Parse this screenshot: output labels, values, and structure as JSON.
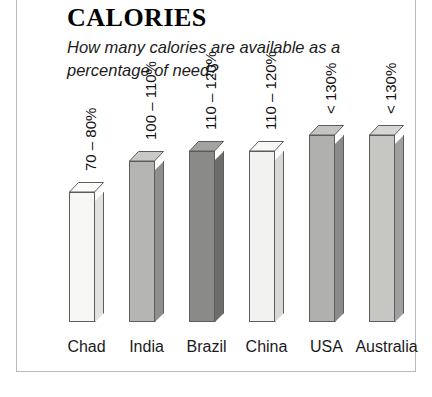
{
  "figure": {
    "title": "CALORIES",
    "subtitle": "How many calories are available as a percentage of need?"
  },
  "chart_data": {
    "type": "bar",
    "title": "CALORIES",
    "subtitle": "How many calories are available as a percentage of need?",
    "xlabel": "",
    "ylabel": "",
    "grid": false,
    "legend": "none",
    "style": "3d-columns",
    "ylim": [
      0,
      140
    ],
    "categories": [
      "Chad",
      "India",
      "Brazil",
      "China",
      "USA",
      "Australia"
    ],
    "value_labels": [
      "70 – 80%",
      "100 – 110%",
      "110 – 120%",
      "110 – 120%",
      "< 130%",
      "< 130%"
    ],
    "values": [
      75,
      105,
      115,
      115,
      130,
      130
    ],
    "bars": [
      {
        "category": "Chad",
        "value_label": "70 – 80%",
        "value": 75,
        "front_color": "#f7f7f5",
        "side_color": "#e2e2df",
        "top_color": "#fcfcfb"
      },
      {
        "category": "India",
        "value_label": "100 – 110%",
        "value": 105,
        "front_color": "#b5b5b3",
        "side_color": "#8e8e8c",
        "top_color": "#c9c9c6"
      },
      {
        "category": "Brazil",
        "value_label": "110 – 120%",
        "value": 115,
        "front_color": "#8a8a88",
        "side_color": "#6d6d6b",
        "top_color": "#a3a3a0"
      },
      {
        "category": "China",
        "value_label": "110 – 120%",
        "value": 115,
        "front_color": "#f2f2f0",
        "side_color": "#d8d8d4",
        "top_color": "#f8f8f6"
      },
      {
        "category": "USA",
        "value_label": "< 130%",
        "value": 130,
        "front_color": "#b0b0ae",
        "side_color": "#8a8a88",
        "top_color": "#c4c4c1"
      },
      {
        "category": "Australia",
        "value_label": "< 130%",
        "value": 130,
        "front_color": "#c6c6c3",
        "side_color": "#a0a09e",
        "top_color": "#d6d6d3"
      }
    ]
  },
  "colors": {
    "frame_border": "#b9b9b9",
    "bar_outline": "#5d5d5d",
    "text": "#1a1a1a",
    "background": "#ffffff"
  }
}
